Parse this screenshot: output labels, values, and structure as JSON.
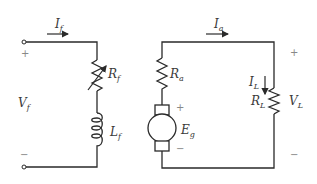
{
  "diagram": {
    "field_circuit": {
      "current": {
        "symbol": "I",
        "sub": "f"
      },
      "voltage": {
        "symbol": "V",
        "sub": "f"
      },
      "resistor": {
        "symbol": "R",
        "sub": "f",
        "type": "variable-resistor"
      },
      "inductor": {
        "symbol": "L",
        "sub": "f"
      },
      "plus": "+",
      "minus": "−"
    },
    "armature_circuit": {
      "current": {
        "symbol": "I",
        "sub": "a"
      },
      "resistor": {
        "symbol": "R",
        "sub": "a"
      },
      "emf": {
        "symbol": "E",
        "sub": "g"
      },
      "emf_plus": "+",
      "emf_minus": "−"
    },
    "load": {
      "current": {
        "symbol": "I",
        "sub": "L"
      },
      "resistor": {
        "symbol": "R",
        "sub": "L"
      },
      "voltage": {
        "symbol": "V",
        "sub": "L"
      },
      "plus": "+",
      "minus": "−"
    },
    "colors": {
      "line": "#2a2a2a",
      "text": "#3a3a3a",
      "sign": "#888888"
    }
  }
}
